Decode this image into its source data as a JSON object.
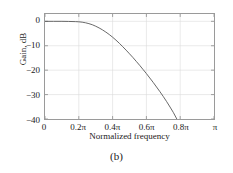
{
  "caption": "(b)",
  "chart_data": {
    "type": "line",
    "title": "",
    "xlabel": "Normalized frequency",
    "ylabel": "Gain, dB",
    "xlim": [
      0,
      1.0
    ],
    "ylim": [
      -40,
      3
    ],
    "grid": true,
    "legend": null,
    "x_unit": "pi",
    "xticks": [
      0,
      0.2,
      0.4,
      0.6,
      0.8,
      1.0
    ],
    "xtick_labels": [
      "0",
      "0.2π",
      "0.4π",
      "0.6π",
      "0.8π",
      "π"
    ],
    "yticks": [
      0,
      -10,
      -20,
      -30,
      -40
    ],
    "ytick_labels": [
      "0",
      "−10",
      "−20",
      "−30",
      "−40"
    ],
    "series": [
      {
        "name": "magnitude response",
        "color": "#555555",
        "x": [
          0.0,
          0.05,
          0.1,
          0.14,
          0.18,
          0.2,
          0.22,
          0.24,
          0.26,
          0.28,
          0.3,
          0.32,
          0.34,
          0.36,
          0.38,
          0.4,
          0.42,
          0.44,
          0.46,
          0.48,
          0.5,
          0.52,
          0.54,
          0.56,
          0.58,
          0.6,
          0.62,
          0.64,
          0.66,
          0.68,
          0.7,
          0.72,
          0.74,
          0.76,
          0.78
        ],
        "y": [
          0.0,
          0.0,
          0.0,
          -0.05,
          -0.12,
          -0.2,
          -0.35,
          -0.6,
          -0.95,
          -1.4,
          -2.0,
          -2.7,
          -3.5,
          -4.4,
          -5.4,
          -6.5,
          -7.7,
          -9.0,
          -10.4,
          -11.8,
          -13.3,
          -14.8,
          -16.4,
          -18.0,
          -19.7,
          -21.4,
          -23.2,
          -25.0,
          -26.9,
          -28.8,
          -30.8,
          -32.9,
          -35.1,
          -37.4,
          -40.0
        ]
      }
    ],
    "annotations": []
  }
}
